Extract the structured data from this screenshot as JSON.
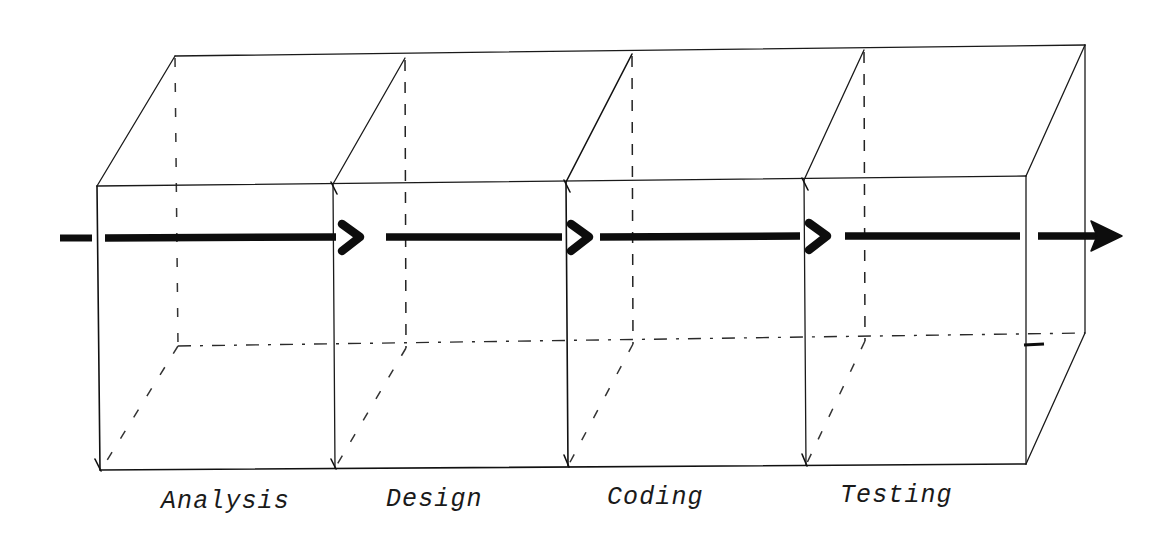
{
  "figure": {
    "kind": "hand-drawn-3d-pipeline-diagram",
    "background_color": "#ffffff",
    "ink_color": "#0d0d0d",
    "line_color": "#111111",
    "phases": [
      {
        "id": "phase-analysis",
        "label": "Analysis",
        "label_x": 161,
        "label_y": 508,
        "front_left_x": 99,
        "front_right_x": 333
      },
      {
        "id": "phase-design",
        "label": "Design",
        "label_x": 386,
        "label_y": 506,
        "front_left_x": 333,
        "front_right_x": 566
      },
      {
        "id": "phase-coding",
        "label": "Coding",
        "label_x": 607,
        "label_y": 504,
        "front_left_x": 566,
        "front_right_x": 804
      },
      {
        "id": "phase-testing",
        "label": "Testing",
        "label_x": 840,
        "label_y": 502,
        "front_left_x": 804,
        "front_right_x": 1026
      }
    ],
    "box": {
      "front_top_left": {
        "x": 97,
        "y": 186
      },
      "front_top_right": {
        "x": 1026,
        "y": 176
      },
      "front_bottom_left": {
        "x": 100,
        "y": 470
      },
      "front_bottom_right": {
        "x": 1026,
        "y": 464
      },
      "back_top_left": {
        "x": 175,
        "y": 56
      },
      "back_top_right": {
        "x": 1085,
        "y": 45
      },
      "back_bottom_left": {
        "x": 178,
        "y": 345
      },
      "back_bottom_right": {
        "x": 1085,
        "y": 333
      }
    },
    "dividers": [
      {
        "id": "divider-1",
        "front_x": 333,
        "back_x": 405
      },
      {
        "id": "divider-2",
        "front_x": 566,
        "back_x": 632
      },
      {
        "id": "divider-3",
        "front_x": 804,
        "back_x": 864
      }
    ],
    "flow": {
      "baseline_y": 237,
      "entry_stub": {
        "x1": 60,
        "x2": 92
      },
      "segments": [
        {
          "id": "flow-segment-analysis",
          "x1": 105,
          "x2": 336
        },
        {
          "id": "flow-segment-design",
          "x1": 386,
          "x2": 562
        },
        {
          "id": "flow-segment-coding",
          "x1": 600,
          "x2": 800
        },
        {
          "id": "flow-segment-testing",
          "x1": 845,
          "x2": 1020
        },
        {
          "id": "flow-segment-exit",
          "x1": 1038,
          "x2": 1100
        }
      ],
      "chevrons": [
        {
          "id": "chevron-analysis-to-design",
          "x": 345,
          "y": 237
        },
        {
          "id": "chevron-design-to-coding",
          "x": 574,
          "y": 237
        },
        {
          "id": "chevron-coding-to-testing",
          "x": 812,
          "y": 237
        }
      ],
      "exit_arrowhead": {
        "id": "arrowhead-exit",
        "x": 1100,
        "y": 236
      }
    }
  }
}
